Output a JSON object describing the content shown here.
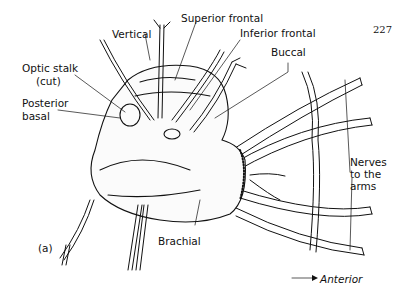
{
  "page_number": "227",
  "figure_panel": "(a)",
  "labels": {
    "vertical": "Vertical",
    "superior_frontal": "Superior frontal",
    "inferior_frontal": "Inferior frontal",
    "buccal": "Buccal",
    "optic_stalk_line1": "Optic stalk",
    "optic_stalk_line2": "(cut)",
    "posterior_basal_line1": "Posterior",
    "posterior_basal_line2": "basal",
    "brachial": "Brachial",
    "nerves_line1": "Nerves",
    "nerves_line2": "to the",
    "nerves_line3": "arms"
  },
  "orientation": {
    "arrow": "→",
    "label": "Anterior"
  },
  "colors": {
    "ink": "#111111",
    "paper": "#ffffff"
  }
}
